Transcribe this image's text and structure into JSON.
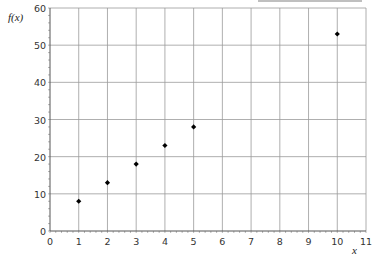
{
  "chart_data": {
    "type": "scatter",
    "title": "",
    "xlabel": "x",
    "ylabel": "f(x)",
    "xlim": [
      0,
      11
    ],
    "ylim": [
      0,
      60
    ],
    "x_ticks": [
      0,
      1,
      2,
      3,
      4,
      5,
      6,
      7,
      8,
      9,
      10,
      11
    ],
    "y_ticks": [
      0,
      10,
      20,
      30,
      40,
      50,
      60
    ],
    "grid": true,
    "legend": null,
    "series": [
      {
        "name": "f(x)",
        "marker": "diamond",
        "color": "#000000",
        "x": [
          1,
          2,
          3,
          4,
          5,
          10
        ],
        "y": [
          8,
          13,
          18,
          23,
          28,
          53
        ]
      }
    ]
  },
  "labels": {
    "x_axis": "x",
    "y_axis": "f(x)"
  }
}
